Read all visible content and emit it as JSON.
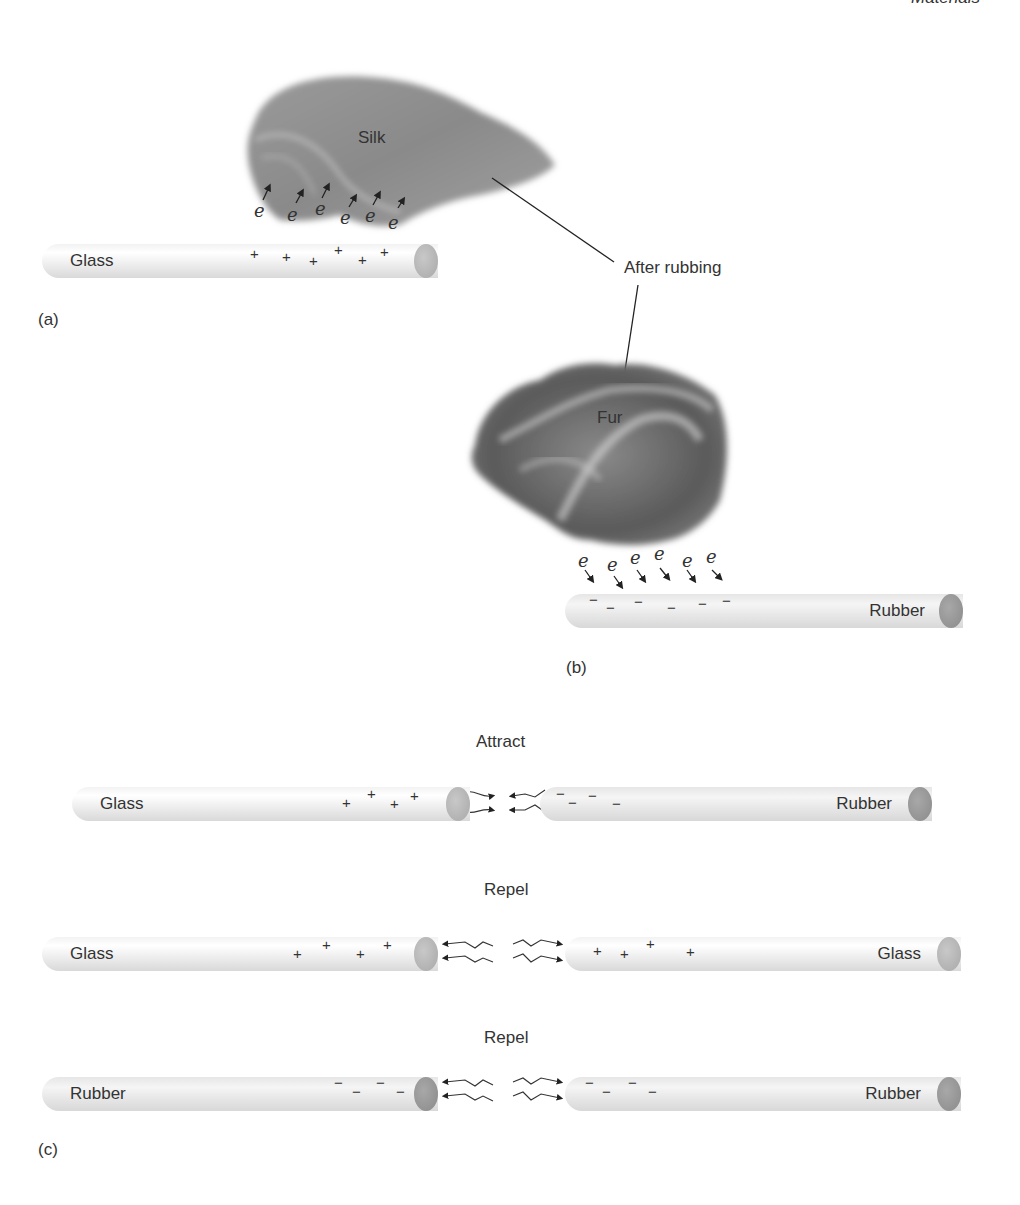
{
  "header": {
    "running_head": "Materials"
  },
  "panel_a": {
    "label": "(a)",
    "cloth_label": "Silk",
    "rod_label": "Glass",
    "electron_symbol": "e",
    "electron_count": 6,
    "charges": [
      "+",
      "+",
      "+",
      "+",
      "+",
      "+"
    ]
  },
  "callout": {
    "text": "After rubbing"
  },
  "panel_b": {
    "label": "(b)",
    "cloth_label": "Fur",
    "rod_label": "Rubber",
    "electron_symbol": "e",
    "electron_count": 6,
    "charges": [
      "−",
      "−",
      "−",
      "−",
      "−",
      "−"
    ]
  },
  "panel_c": {
    "label": "(c)",
    "rows": [
      {
        "title": "Attract",
        "left_rod": "Glass",
        "left_charges": [
          "+",
          "+",
          "+",
          "+"
        ],
        "right_rod": "Rubber",
        "right_charges": [
          "−",
          "−",
          "−",
          "−"
        ],
        "interaction": "attract"
      },
      {
        "title": "Repel",
        "left_rod": "Glass",
        "left_charges": [
          "+",
          "+",
          "+",
          "+"
        ],
        "right_rod": "Glass",
        "right_charges": [
          "+",
          "+",
          "+",
          "+"
        ],
        "interaction": "repel"
      },
      {
        "title": "Repel",
        "left_rod": "Rubber",
        "left_charges": [
          "−",
          "−",
          "−",
          "−"
        ],
        "right_rod": "Rubber",
        "right_charges": [
          "−",
          "−",
          "−",
          "−"
        ],
        "interaction": "repel"
      }
    ]
  },
  "colors": {
    "glass_end": "#b0b0b0",
    "rubber_end": "#909090",
    "text": "#333333"
  }
}
